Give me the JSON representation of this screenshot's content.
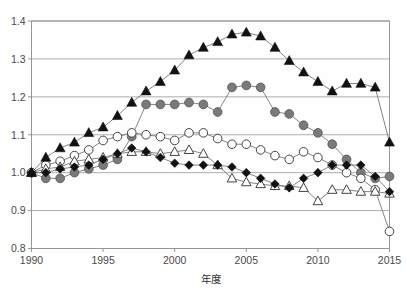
{
  "figure": {
    "title_fragment": "",
    "background": "#ffffff"
  },
  "chart_data": {
    "type": "line",
    "title": "",
    "xlabel": "年度",
    "ylabel": "",
    "xlim": [
      1990,
      2015
    ],
    "ylim": [
      0.8,
      1.4
    ],
    "grid": true,
    "grid_axis": "y",
    "legend": "none",
    "x_ticks": [
      "1990",
      "1995",
      "2000",
      "2005",
      "2010",
      "2015"
    ],
    "y_ticks": [
      "0.8",
      "0.9",
      "1.0",
      "1.1",
      "1.2",
      "1.3",
      "1.4"
    ],
    "x": [
      1990,
      1991,
      1992,
      1993,
      1994,
      1995,
      1996,
      1997,
      1998,
      1999,
      2000,
      2001,
      2002,
      2003,
      2004,
      2005,
      2006,
      2007,
      2008,
      2009,
      2010,
      2011,
      2012,
      2013,
      2014,
      2015
    ],
    "series": [
      {
        "name": "filled-triangle-series",
        "marker": "triangle-filled",
        "color": "#111111",
        "fill": "#111111",
        "values": [
          1.0,
          1.04,
          1.065,
          1.08,
          1.105,
          1.12,
          1.15,
          1.185,
          1.215,
          1.24,
          1.27,
          1.31,
          1.33,
          1.345,
          1.365,
          1.37,
          1.36,
          1.33,
          1.295,
          1.265,
          1.24,
          1.215,
          1.235,
          1.235,
          1.225,
          1.08
        ]
      },
      {
        "name": "filled-circle-series",
        "marker": "circle-filled",
        "color": "#6f6f6f",
        "fill": "#7a7a7a",
        "values": [
          1.0,
          0.985,
          0.985,
          1.0,
          1.01,
          1.02,
          1.035,
          1.095,
          1.18,
          1.18,
          1.18,
          1.185,
          1.18,
          1.16,
          1.225,
          1.23,
          1.225,
          1.16,
          1.155,
          1.125,
          1.105,
          1.075,
          1.035,
          1.0,
          0.985,
          0.99
        ]
      },
      {
        "name": "open-circle-series",
        "marker": "circle-open",
        "color": "#555555",
        "fill": "#ffffff",
        "values": [
          1.0,
          1.02,
          1.03,
          1.045,
          1.06,
          1.085,
          1.095,
          1.105,
          1.1,
          1.095,
          1.085,
          1.105,
          1.105,
          1.09,
          1.075,
          1.075,
          1.06,
          1.045,
          1.035,
          1.055,
          1.04,
          1.02,
          1.0,
          0.985,
          0.955,
          0.845
        ]
      },
      {
        "name": "filled-diamond-series",
        "marker": "diamond-filled",
        "color": "#111111",
        "fill": "#111111",
        "values": [
          1.0,
          1.0,
          1.01,
          1.015,
          1.02,
          1.035,
          1.05,
          1.065,
          1.055,
          1.04,
          1.025,
          1.02,
          1.02,
          1.02,
          1.015,
          1.0,
          0.985,
          0.97,
          0.96,
          0.985,
          1.0,
          1.02,
          1.02,
          1.02,
          0.99,
          0.95
        ]
      },
      {
        "name": "open-triangle-series",
        "marker": "triangle-open",
        "color": "#555555",
        "fill": "#ffffff",
        "values": [
          1.0,
          1.01,
          1.015,
          1.03,
          1.035,
          1.04,
          1.05,
          1.055,
          1.055,
          1.05,
          1.055,
          1.06,
          1.05,
          1.02,
          0.985,
          0.975,
          0.97,
          0.965,
          0.965,
          0.96,
          0.925,
          0.955,
          0.955,
          0.95,
          0.95,
          0.945
        ]
      }
    ]
  }
}
